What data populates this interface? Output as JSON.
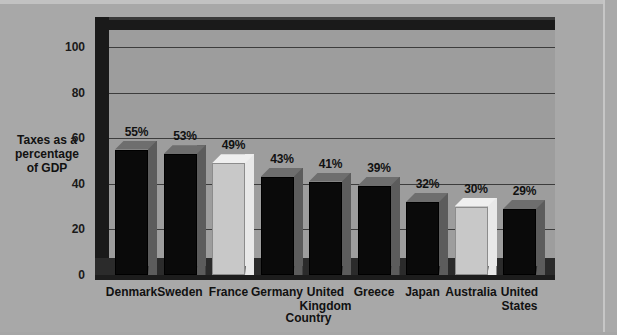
{
  "chart_data": {
    "type": "bar",
    "title": "",
    "subtitle": "",
    "xlabel": "Country",
    "ylabel": "Taxes as a percentage of GDP",
    "ylabel_lines": [
      "Taxes as a",
      "percentage",
      "of GDP"
    ],
    "categories": [
      "Denmark",
      "Sweden",
      "France",
      "Germany",
      "United Kingdom",
      "Greece",
      "Japan",
      "Australia",
      "United States"
    ],
    "category_lines": [
      [
        "Denmark"
      ],
      [
        "Sweden"
      ],
      [
        "France"
      ],
      [
        "Germany"
      ],
      [
        "United",
        "Kingdom"
      ],
      [
        "Greece"
      ],
      [
        "Japan"
      ],
      [
        "Australia"
      ],
      [
        "United",
        "States"
      ]
    ],
    "values": [
      55,
      53,
      49,
      43,
      41,
      39,
      32,
      30,
      29
    ],
    "data_labels": [
      "55%",
      "53%",
      "49%",
      "43%",
      "41%",
      "39%",
      "32%",
      "30%",
      "29%"
    ],
    "bar_styles": [
      "dark",
      "dark",
      "light",
      "dark",
      "dark",
      "dark",
      "dark",
      "light",
      "dark"
    ],
    "ylim": [
      0,
      100
    ],
    "yticks": [
      0,
      20,
      40,
      60,
      80,
      100
    ],
    "ytick_labels": [
      "0",
      "20",
      "40",
      "60",
      "80",
      "100"
    ],
    "grid": true,
    "grid_axis": "y",
    "legend": "none",
    "style": "3d-column"
  },
  "colors": {
    "background": "#a8a8a8",
    "plot_panel": "#9d9d9d",
    "wall": "#1a1a1a",
    "floor": "#2b2b2b",
    "gridline": "#3c3c3c",
    "bar_dark_face": "#0a0a0a",
    "bar_dark_side": "#5c5c5c",
    "bar_dark_top": "#6e6e6e",
    "bar_light_face": "#c8c8c8",
    "bar_light_side": "#e8e8e8",
    "bar_light_top": "#efefef",
    "text": "#111111"
  }
}
